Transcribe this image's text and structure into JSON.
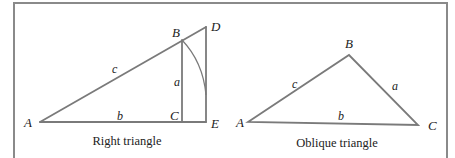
{
  "figures": {
    "right_triangle": {
      "caption": "Right triangle",
      "vertices": {
        "A": "A",
        "B": "B",
        "C": "C",
        "D": "D",
        "E": "E"
      },
      "sides": {
        "a": "a",
        "b": "b",
        "c": "c"
      }
    },
    "oblique_triangle": {
      "caption": "Oblique triangle",
      "vertices": {
        "A": "A",
        "B": "B",
        "C": "C"
      },
      "sides": {
        "a": "a",
        "b": "b",
        "c": "c"
      }
    }
  },
  "colors": {
    "line": "#7a7a7a",
    "frame": "#8a8a8a",
    "text": "#222222"
  }
}
